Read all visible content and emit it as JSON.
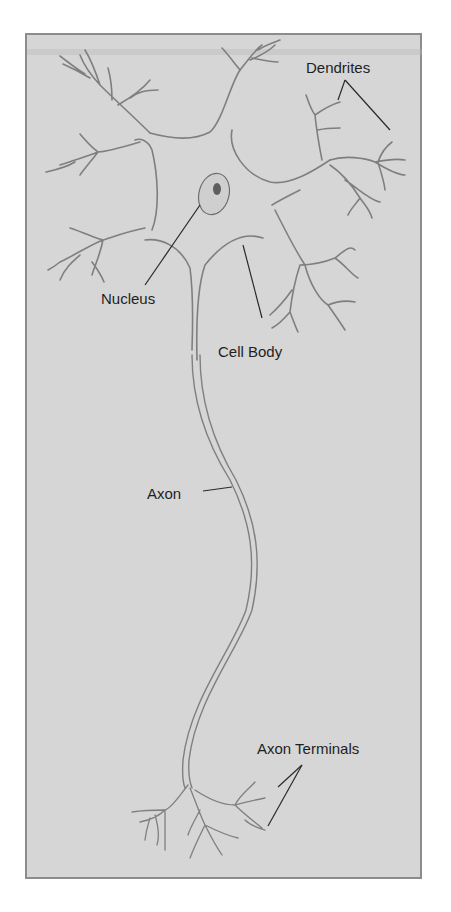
{
  "figure": {
    "labels": {
      "dendrites": "Dendrites",
      "nucleus": "Nucleus",
      "cell_body": "Cell Body",
      "axon": "Axon",
      "axon_terminals": "Axon Terminals"
    },
    "colors": {
      "background": "#d6d6d6",
      "frame_border": "#8c8c8c",
      "cell_outline": "#7a7a7a",
      "leader_line": "#2a2a2a",
      "text": "#1f1f1f"
    }
  }
}
